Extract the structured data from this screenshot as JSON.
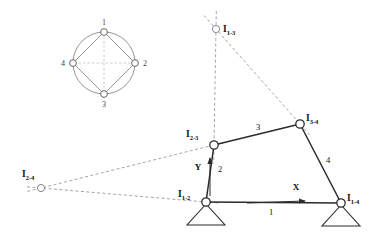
{
  "diagram": {
    "colors": {
      "link": "#2b2b2b",
      "dashed": "#9a9a9a",
      "node_stroke": "#2b2b2b",
      "node_fill": "#ffffff",
      "graph_stroke": "#8a8a8a",
      "text": "#111111"
    },
    "kennedy_circle": {
      "name": "instant-center-circle-graph",
      "center": {
        "x": 104,
        "y": 63
      },
      "radius": 31,
      "nodes": [
        {
          "id": "n1",
          "label": "1",
          "x": 104,
          "y": 32,
          "label_x": 104,
          "label_y": 25
        },
        {
          "id": "n2",
          "label": "2",
          "x": 135,
          "y": 63,
          "label_x": 143,
          "label_y": 66
        },
        {
          "id": "n3",
          "label": "3",
          "x": 104,
          "y": 94,
          "label_x": 104,
          "label_y": 107
        },
        {
          "id": "n4",
          "label": "4",
          "x": 73,
          "y": 63,
          "label_x": 65,
          "label_y": 66
        }
      ],
      "solid_chords": [
        {
          "from": "n1",
          "to": "n2"
        },
        {
          "from": "n2",
          "to": "n3"
        },
        {
          "from": "n3",
          "to": "n4"
        },
        {
          "from": "n4",
          "to": "n1"
        }
      ],
      "dashed_chords": [
        {
          "from": "n1",
          "to": "n3"
        },
        {
          "from": "n2",
          "to": "n4"
        }
      ]
    },
    "joints": [
      {
        "name": "I12",
        "label": "I",
        "sub": "1-2",
        "x": 206,
        "y": 202,
        "label_x": 178,
        "label_y": 197,
        "type": "ground-pivot"
      },
      {
        "name": "I14",
        "label": "I",
        "sub": "1-4",
        "x": 341,
        "y": 203,
        "label_x": 347,
        "label_y": 201,
        "type": "ground-pivot"
      },
      {
        "name": "I23",
        "label": "I",
        "sub": "2-3",
        "x": 214,
        "y": 145,
        "label_x": 186,
        "label_y": 137,
        "type": "pin"
      },
      {
        "name": "I34",
        "label": "I",
        "sub": "3-4",
        "x": 300,
        "y": 124,
        "label_x": 306,
        "label_y": 121,
        "type": "pin"
      },
      {
        "name": "I13",
        "label": "I",
        "sub": "1-3",
        "x": 216,
        "y": 29,
        "label_x": 223,
        "label_y": 32,
        "type": "instant-center"
      },
      {
        "name": "I24",
        "label": "I",
        "sub": "2-4",
        "x": 41,
        "y": 188,
        "label_x": 22,
        "label_y": 177,
        "type": "instant-center"
      }
    ],
    "links": [
      {
        "name": "link-1-ground",
        "label": "1",
        "from": "I12",
        "to": "I14",
        "label_x": 271,
        "label_y": 215
      },
      {
        "name": "link-2-crank",
        "label": "2",
        "from": "I12",
        "to": "I23",
        "label_x": 220,
        "label_y": 172
      },
      {
        "name": "link-3-coupler",
        "label": "3",
        "from": "I23",
        "to": "I34",
        "label_x": 258,
        "label_y": 130
      },
      {
        "name": "link-4-rocker",
        "label": "4",
        "from": "I34",
        "to": "I14",
        "label_x": 328,
        "label_y": 163
      }
    ],
    "construction_lines": [
      {
        "name": "line-I13-to-I23",
        "from": "I13",
        "to": "I23",
        "extend_beyond": 18
      },
      {
        "name": "line-I13-to-I34",
        "from": "I13",
        "to": "I34",
        "extend_beyond": 18
      },
      {
        "name": "line-I24-to-I23",
        "from": "I24",
        "to": "I23",
        "extend_beyond": 14
      },
      {
        "name": "line-I24-to-I12",
        "from": "I24",
        "to": "I12",
        "extend_beyond": 14
      }
    ],
    "axes": {
      "x_axis": {
        "label": "X",
        "label_x": 296,
        "label_y": 190,
        "start_x": 247,
        "start_y": 203,
        "end_x": 305,
        "end_y": 201
      },
      "y_axis": {
        "label": "Y",
        "label_x": 198,
        "label_y": 170,
        "start_x": 210,
        "start_y": 196,
        "end_x": 210,
        "end_y": 158
      }
    }
  }
}
